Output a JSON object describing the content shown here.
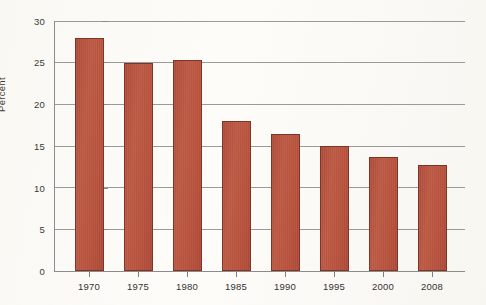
{
  "chart_data": {
    "type": "bar",
    "title": "",
    "subtitle": "",
    "xlabel": "",
    "ylabel": "Percent",
    "categories": [
      "1970",
      "1975",
      "1980",
      "1985",
      "1990",
      "1995",
      "2000",
      "2008"
    ],
    "values": [
      28.0,
      25.0,
      25.3,
      18.0,
      16.4,
      15.0,
      13.7,
      12.7
    ],
    "ylim": [
      0,
      30
    ],
    "ytick_labels": [
      "0",
      "5",
      "10",
      "15",
      "20",
      "25",
      "30"
    ],
    "ytick_values": [
      0,
      5,
      10,
      15,
      20,
      25,
      30
    ],
    "grid": "horizontal",
    "legend": "none",
    "series": [
      {
        "name": "Percent",
        "color": "#b8523d",
        "values": [
          28.0,
          25.0,
          25.3,
          18.0,
          16.4,
          15.0,
          13.7,
          12.7
        ]
      }
    ],
    "annotations": []
  },
  "colors": {
    "bar_fill": "#b8523d",
    "bar_edge": "#7c3527",
    "gridline": "#9a9a9a",
    "axis": "#8c8c8c",
    "tick_text": "#333333",
    "background": "#fbfaf7"
  }
}
